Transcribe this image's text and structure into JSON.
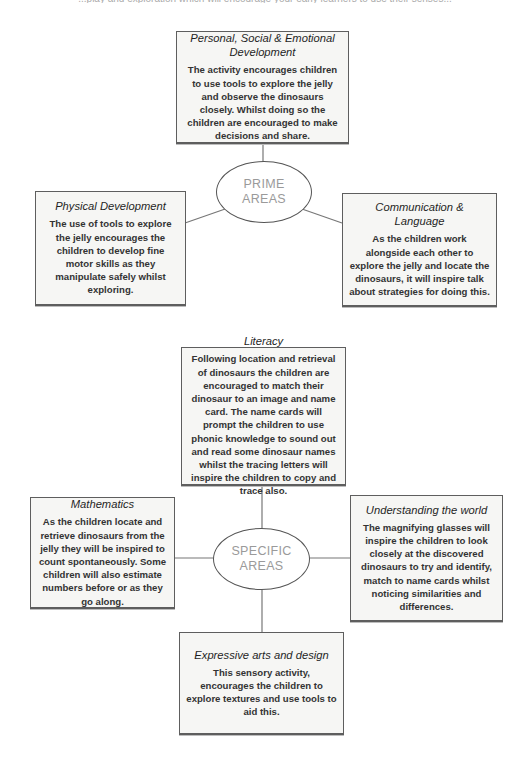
{
  "page": {
    "cutoff_text": "...play and exploration which will encourage your early learners to use their senses..."
  },
  "prime": {
    "hub": {
      "line1": "PRIME",
      "line2": "AREAS"
    },
    "boxes": [
      {
        "id": "psed",
        "title": "Personal, Social & Emotional Development",
        "text": "The activity encourages children to use tools to explore the jelly and observe the dinosaurs closely. Whilst doing so the children are encouraged to make decisions and share."
      },
      {
        "id": "physical",
        "title": "Physical Development",
        "text": "The use of tools to explore the jelly encourages the children to develop fine motor skills as they manipulate safely whilst exploring."
      },
      {
        "id": "communication",
        "title": "Communication & Language",
        "text": "As the children work alongside each other to explore the jelly and locate the dinosaurs, it will inspire talk about strategies for doing this."
      }
    ]
  },
  "specific": {
    "hub": {
      "line1": "SPECIFIC",
      "line2": "AREAS"
    },
    "boxes": [
      {
        "id": "literacy",
        "title": "Literacy",
        "text": "Following location and retrieval of dinosaurs the children are encouraged to match their dinosaur to an image and name card. The name cards will prompt the children to use phonic knowledge to sound out and read some dinosaur names whilst the tracing letters will inspire the children to copy and trace also."
      },
      {
        "id": "mathematics",
        "title": "Mathematics",
        "text": "As the children locate and retrieve dinosaurs from the jelly they will be inspired to count spontaneously. Some children will also estimate numbers before or as they go along."
      },
      {
        "id": "understanding",
        "title": "Understanding the world",
        "text": "The magnifying glasses will inspire the children to look closely at the discovered dinosaurs to try and identify, match to name cards whilst noticing similarities and differences."
      },
      {
        "id": "expressive",
        "title": "Expressive arts and design",
        "text": "This sensory activity, encourages the children to explore textures and use tools to aid this."
      }
    ]
  },
  "colors": {
    "box_fill": "#f6f6f4",
    "box_border": "#5e5e5e",
    "connector": "#777777",
    "hub_text": "#9a9a9a"
  }
}
